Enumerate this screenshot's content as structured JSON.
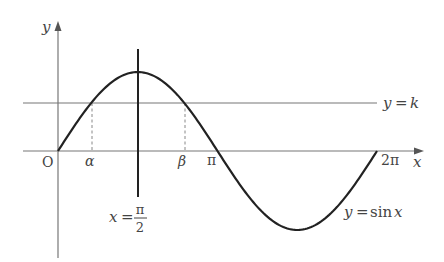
{
  "diagram": {
    "type": "function-graph",
    "colors": {
      "axis": "#777777",
      "curve": "#222222",
      "line_k": "#777777",
      "guide_line": "#222222",
      "dashed": "#888888",
      "text": "#444444"
    },
    "axes": {
      "x_label": "x",
      "y_label": "y",
      "origin_label": "O"
    },
    "ticks": {
      "alpha": "α",
      "beta": "β",
      "pi": "π",
      "two_pi": "2π"
    },
    "curve": {
      "label": "y = sin x",
      "label_lhs": "y",
      "label_eq": "=",
      "label_fn": "sin",
      "label_arg": "x",
      "domain": [
        0,
        6.2832
      ]
    },
    "horizontal_line": {
      "label": "y = k",
      "label_lhs": "y",
      "label_eq": "=",
      "label_rhs": "k",
      "k_approx": 0.61
    },
    "vertical_line": {
      "label": "x = π/2",
      "label_lhs": "x",
      "label_eq": "=",
      "numerator": "π",
      "denominator": "2"
    }
  }
}
